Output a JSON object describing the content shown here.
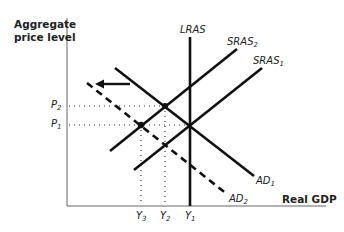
{
  "diagram": {
    "type": "AD-AS model",
    "axes": {
      "y_label_line1": "Aggregate",
      "y_label_line2": "price level",
      "x_label": "Real GDP"
    },
    "curves": {
      "lras": {
        "name": "LRAS"
      },
      "sras2": {
        "name": "SRAS",
        "sub": "2"
      },
      "sras1": {
        "name": "SRAS",
        "sub": "1"
      },
      "ad1": {
        "name": "AD",
        "sub": "1"
      },
      "ad2": {
        "name": "AD",
        "sub": "2",
        "style": "dashed"
      }
    },
    "price_ticks": [
      {
        "name": "P",
        "sub": "2"
      },
      {
        "name": "P",
        "sub": "1"
      }
    ],
    "output_ticks": [
      {
        "name": "Y",
        "sub": "3"
      },
      {
        "name": "Y",
        "sub": "2"
      },
      {
        "name": "Y",
        "sub": "1"
      }
    ],
    "annotation": "leftward shift arrow from AD1 to AD2",
    "colors": {
      "line": "#111111",
      "text": "#222222",
      "axis": "#555555"
    }
  }
}
